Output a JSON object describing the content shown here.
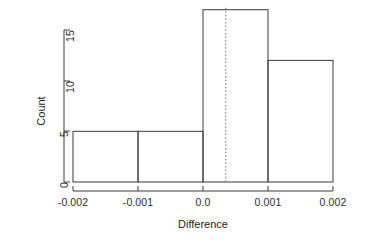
{
  "chart_data": {
    "type": "bar",
    "title": "",
    "subtitle": "",
    "xlabel": "Difference",
    "ylabel": "Count",
    "categories": [
      "-0.002 to -0.001",
      "-0.001 to 0.0",
      "0.0 to 0.001",
      "0.001 to 0.002"
    ],
    "bin_edges": [
      -0.002,
      -0.001,
      0.0,
      0.001,
      0.002
    ],
    "values": [
      5,
      5,
      17,
      12
    ],
    "xlim": [
      -0.002,
      0.002
    ],
    "ylim": [
      0,
      17
    ],
    "x_ticks": [
      -0.002,
      -0.001,
      0.0,
      0.001,
      0.002
    ],
    "x_tick_labels": [
      "-0.002",
      "-0.001",
      "0.0",
      "0.001",
      "0.002"
    ],
    "y_ticks": [
      0,
      5,
      10,
      15
    ],
    "y_tick_labels": [
      "0",
      "5",
      "10",
      "15"
    ],
    "grid": false,
    "legend": false,
    "legend_position": "none",
    "annotations": [
      {
        "name": "reference-line",
        "type": "vertical-dotted-line",
        "x": 0.00035,
        "style": "dotted",
        "color": "#555555"
      }
    ],
    "style": {
      "bar_fill": "none",
      "bar_stroke": "#3a3a3a",
      "axis_color": "#3a3a3a",
      "background": "#ffffff"
    }
  }
}
